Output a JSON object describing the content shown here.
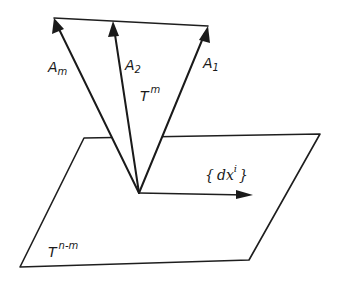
{
  "figure": {
    "vectors": [
      {
        "name": "A_m",
        "base": "A",
        "subscript": "m"
      },
      {
        "name": "A_2",
        "base": "A",
        "subscript": "2"
      },
      {
        "name": "A_1",
        "base": "A",
        "subscript": "1"
      }
    ],
    "labels": {
      "a_m_base": "A",
      "a_m_sub": "m",
      "a2_base": "A",
      "a2_sub": "2",
      "a1_base": "A",
      "a1_sub": "1",
      "tm_base": "T",
      "tm_sup": "m",
      "plane_base": "T",
      "plane_sup": "n-m",
      "dx_open": "{",
      "dx_body": "dx",
      "dx_sup": "i",
      "dx_close": "}"
    },
    "colors": {
      "ink": "#1a1a1a",
      "background": "#ffffff"
    }
  }
}
